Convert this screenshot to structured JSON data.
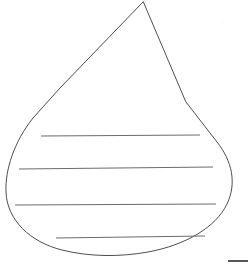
{
  "document": {
    "title": "Teardrop Writing Lines Template",
    "kind": "line-art-worksheet",
    "background_color": "#ffffff",
    "width": 248,
    "height": 271
  },
  "shape": {
    "name": "teardrop-outline",
    "description": "Water drop / teardrop outline with pointed apex at top and rounded bulb at bottom",
    "stroke_color": "#3a3a3f",
    "stroke_width": 0.9,
    "fill": "none",
    "apex": {
      "x": 143,
      "y": 2
    },
    "leftmost": {
      "x": 6,
      "y": 193
    },
    "rightmost": {
      "x": 231,
      "y": 190
    },
    "bottom": {
      "x": 124,
      "y": 255
    },
    "path": "M 143 2 L 60 88 L 33 118 C 14 142 5 170 6 192 C 7 220 30 242 62 250 C 90 257 120 257 148 252 C 186 245 216 227 227 204 C 237 183 232 161 217 142 L 186 102 Z"
  },
  "writing_lines": {
    "name": "writing-lines",
    "stroke_color": "#6b6b70",
    "stroke_width": 1,
    "count": 4,
    "lines": [
      {
        "id": "line-1",
        "x1": 41,
        "y1": 136,
        "x2": 200,
        "y2": 135
      },
      {
        "id": "line-2",
        "x1": 19,
        "y1": 169,
        "x2": 213,
        "y2": 167
      },
      {
        "id": "line-3",
        "x1": 15,
        "y1": 205,
        "x2": 216,
        "y2": 204
      },
      {
        "id": "line-4",
        "x1": 56,
        "y1": 238,
        "x2": 205,
        "y2": 236
      }
    ]
  },
  "corner_mark": {
    "name": "corner-rule-mark",
    "color": "#55555a",
    "x": 228,
    "y": 260,
    "width": 20,
    "height": 2
  },
  "speckles": [
    {
      "x": 35,
      "y": 28,
      "r": 0.6,
      "color": "#e8e8ea"
    },
    {
      "x": 222,
      "y": 22,
      "r": 0.7,
      "color": "#ededf0"
    },
    {
      "x": 236,
      "y": 25,
      "r": 0.5,
      "color": "#f0f0f2"
    },
    {
      "x": 191,
      "y": 40,
      "r": 0.5,
      "color": "#f1f1f3"
    },
    {
      "x": 213,
      "y": 40,
      "r": 0.5,
      "color": "#f1f1f3"
    },
    {
      "x": 233,
      "y": 52,
      "r": 0.6,
      "color": "#eeeef1"
    }
  ]
}
